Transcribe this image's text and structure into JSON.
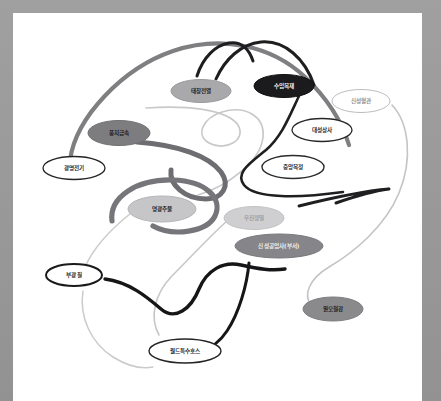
{
  "canvas": {
    "frame_color": "#9a9a9a",
    "background_color": "#ffffff",
    "width": 441,
    "height": 401
  },
  "chart_data": {
    "type": "diagram",
    "title": "",
    "subtitle": "",
    "legend_position": "none",
    "grid": false,
    "node_count": 13,
    "edge_count": 12,
    "nodes": [
      {
        "id": "n1",
        "label": "태창전열",
        "x": 188,
        "y": 78,
        "rx": 30,
        "ry": 11.5,
        "fill": "#a9a9ab",
        "stroke": "#9a9a9c",
        "stroke_width": 1.0,
        "text_color": "#1c1c1e"
      },
      {
        "id": "n2",
        "label": "수입목재",
        "x": 271,
        "y": 73,
        "rx": 30,
        "ry": 11.5,
        "fill": "#1b1b1d",
        "stroke": "#111113",
        "stroke_width": 1.0,
        "text_color": "#f4f4f5"
      },
      {
        "id": "n3",
        "label": "신성혈관",
        "x": 348,
        "y": 88,
        "rx": 29,
        "ry": 11.5,
        "fill": "#ffffff",
        "stroke": "#bdbdbf",
        "stroke_width": 1.0,
        "text_color": "#8e8e90"
      },
      {
        "id": "n4",
        "label": "풍지금속",
        "x": 106,
        "y": 120,
        "rx": 31,
        "ry": 12.5,
        "fill": "#7d7d80",
        "stroke": "#707073",
        "stroke_width": 1.0,
        "text_color": "#17171a"
      },
      {
        "id": "n5",
        "label": "대성상사",
        "x": 309,
        "y": 117,
        "rx": 30,
        "ry": 11.5,
        "fill": "#ffffff",
        "stroke": "#262628",
        "stroke_width": 1.3,
        "text_color": "#1c1c1e"
      },
      {
        "id": "n6",
        "label": "광명전기",
        "x": 61,
        "y": 155,
        "rx": 31,
        "ry": 11.5,
        "fill": "#ffffff",
        "stroke": "#242426",
        "stroke_width": 1.3,
        "text_color": "#1c1c1e"
      },
      {
        "id": "n7",
        "label": "중앙목정",
        "x": 280,
        "y": 154,
        "rx": 31,
        "ry": 11.5,
        "fill": "#ffffff",
        "stroke": "#2b2b2d",
        "stroke_width": 1.4,
        "text_color": "#1c1c1e"
      },
      {
        "id": "n8",
        "label": "영광주물",
        "x": 149,
        "y": 196,
        "rx": 34,
        "ry": 13.0,
        "fill": "#c6c6c8",
        "stroke": "#b5b5b7",
        "stroke_width": 1.0,
        "text_color": "#17171a"
      },
      {
        "id": "n9",
        "label": "우진정밀",
        "x": 241,
        "y": 205,
        "rx": 30,
        "ry": 11.5,
        "fill": "#cfcfd1",
        "stroke": "#c2c2c4",
        "stroke_width": 1.0,
        "text_color": "#9c9c9e"
      },
      {
        "id": "n10",
        "label": "신성공업사(부서)",
        "x": 266,
        "y": 233,
        "rx": 44,
        "ry": 12.0,
        "fill": "#86868a",
        "stroke": "#78787c",
        "stroke_width": 1.0,
        "text_color": "#f2f2f4"
      },
      {
        "id": "n11",
        "label": "부광칠",
        "x": 61,
        "y": 262,
        "rx": 28,
        "ry": 11.0,
        "fill": "#ffffff",
        "stroke": "#1a1a1c",
        "stroke_width": 2.0,
        "text_color": "#1c1c1e"
      },
      {
        "id": "n12",
        "label": "원오철강",
        "x": 320,
        "y": 296,
        "rx": 30,
        "ry": 12.0,
        "fill": "#8a8a8d",
        "stroke": "#7d7d80",
        "stroke_width": 1.0,
        "text_color": "#17171a"
      },
      {
        "id": "n13",
        "label": "월드특수호스",
        "x": 172,
        "y": 338,
        "rx": 36,
        "ry": 12.0,
        "fill": "#ffffff",
        "stroke": "#242426",
        "stroke_width": 1.4,
        "text_color": "#1c1c1e"
      }
    ],
    "edges": [
      {
        "id": "e1",
        "name": "thick-gray-left-arc",
        "color": "#7f7f82",
        "width": 4.2,
        "path": "M 57 147 C 63 104, 110 55, 160 38 C 208 22, 258 32, 292 64 C 318 89, 330 112, 336 132"
      },
      {
        "id": "e2",
        "name": "dark-fork-top-left",
        "color": "#1e1e20",
        "width": 3.0,
        "path": "M 184 63 C 190 44, 203 32, 216 30 C 228 28, 236 36, 240 48"
      },
      {
        "id": "e3",
        "name": "dark-fork-top-right",
        "color": "#1e1e20",
        "width": 3.0,
        "path": "M 203 66 C 212 46, 228 31, 248 29 C 272 27, 292 46, 301 72"
      },
      {
        "id": "e4",
        "name": "light-loop-center-top",
        "color": "#c9c9cb",
        "width": 1.7,
        "path": "M 133 95 C 172 92, 214 96, 225 112 C 234 127, 212 139, 196 130 C 182 122, 190 105, 209 99 C 232 92, 252 103, 250 124 C 248 148, 215 173, 185 182"
      },
      {
        "id": "e5",
        "name": "thick-gray-mid-diagonal",
        "color": "#6e6e72",
        "width": 5.0,
        "path": "M 124 129 C 165 132, 196 143, 208 159 C 218 173, 209 186, 193 186 C 172 186, 156 172, 158 157"
      },
      {
        "id": "e6",
        "name": "thick-gray-spiral-left",
        "color": "#76767a",
        "width": 5.2,
        "path": "M 99 208 C 96 184, 124 166, 160 167 C 194 168, 210 186, 202 203 C 194 219, 160 224, 140 213"
      },
      {
        "id": "e7",
        "name": "dark-loop-right-center",
        "color": "#1f1f21",
        "width": 2.6,
        "path": "M 286 83 C 276 104, 269 123, 253 137 C 236 151, 222 160, 231 172 C 242 186, 286 185, 330 179"
      },
      {
        "id": "e8",
        "name": "dark-tail-right",
        "color": "#1f1f21",
        "width": 3.0,
        "path": "M 286 193 C 318 185, 352 178, 376 176 C 360 178, 340 184, 323 190"
      },
      {
        "id": "e9",
        "name": "light-long-right-sweep",
        "color": "#c4c4c6",
        "width": 1.6,
        "path": "M 379 92 C 396 110, 400 146, 386 180 C 372 214, 340 240, 316 254 C 296 266, 290 282, 298 292"
      },
      {
        "id": "e10",
        "name": "light-curve-lower-center",
        "color": "#c7c7c9",
        "width": 1.6,
        "path": "M 214 208 C 196 224, 176 246, 158 264 C 142 281, 136 304, 146 322"
      },
      {
        "id": "e11",
        "name": "black-zigzag-lower",
        "color": "#161618",
        "width": 3.4,
        "path": "M 92 266 C 116 269, 134 284, 148 296 C 162 308, 178 296, 186 276 C 194 257, 210 248, 228 252 C 246 256, 258 258, 272 256"
      },
      {
        "id": "e12",
        "name": "black-curve-to-hose-node",
        "color": "#161618",
        "width": 3.0,
        "path": "M 236 250 C 234 272, 226 300, 214 318 C 206 330, 196 336, 188 338"
      },
      {
        "id": "e13",
        "name": "light-arc-bottom-left",
        "color": "#cbcbcd",
        "width": 1.5,
        "path": "M 70 278 C 66 304, 78 330, 100 344 C 116 354, 130 356, 140 354"
      },
      {
        "id": "e14",
        "name": "light-arc-left-to-center",
        "color": "#cccccd",
        "width": 1.6,
        "path": "M 118 200 C 98 216, 80 236, 72 254"
      }
    ]
  },
  "accessibility": {
    "diagram_role": "network-graph",
    "alt_text": "Hand-drawn style network diagram with thirteen labelled oval nodes connected by curved lines"
  }
}
